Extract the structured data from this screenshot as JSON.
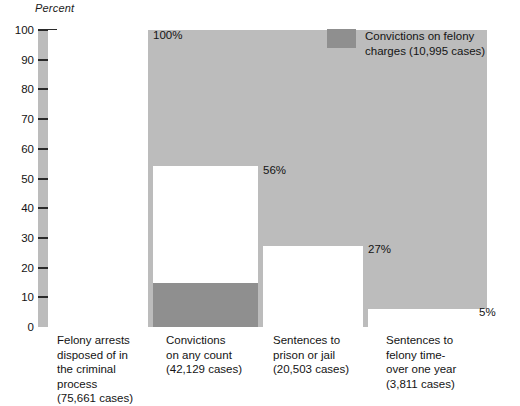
{
  "axis": {
    "title": "Percent",
    "ticks": [
      100,
      90,
      80,
      70,
      60,
      50,
      40,
      30,
      20,
      10,
      0
    ],
    "tick_labels": [
      "100",
      "90",
      "80",
      "70",
      "60",
      "50",
      "40",
      "30",
      "20",
      "10",
      "0"
    ],
    "min": 0,
    "max": 100
  },
  "legend": {
    "label": "Convictions on felony\ncharges (10,995 cases)",
    "swatch_color": "#8f8f8f",
    "swatch_name": "felony-convictions-swatch"
  },
  "colors": {
    "plot_background": "#bcbcbc",
    "bar_fill": "#ffffff",
    "highlight_fill": "#8f8f8f",
    "text": "#141414",
    "tick": "#2a2a2a"
  },
  "bars": [
    {
      "id": "felony-arrests",
      "value_label": "100%",
      "label": "Felony arrests\ndisposed of in\nthe criminal\nprocess\n(75,661 cases)",
      "cases_label": "(75,661 cases)",
      "category": "Felony arrests disposed of in the criminal process"
    },
    {
      "id": "convictions-any-count",
      "value_label": "56%",
      "label": "Convictions\non any count\n(42,129 cases)",
      "cases_label": "(42,129 cases)",
      "category": "Convictions on any count",
      "sub_value_label": "15%",
      "sub_category": "Convictions on felony charges"
    },
    {
      "id": "sentences-prison-jail",
      "value_label": "27%",
      "label": "Sentences to\nprison or jail\n(20,503 cases)",
      "cases_label": "(20,503 cases)",
      "category": "Sentences to prison or jail"
    },
    {
      "id": "sentences-felony-time",
      "value_label": "5%",
      "label": "Sentences to\nfelony time-\nover one year\n(3,811 cases)",
      "cases_label": "(3,811 cases)",
      "category": "Sentences to felony time-over one year"
    }
  ],
  "chart_data": {
    "type": "bar",
    "title": "",
    "subtitle": "",
    "xlabel": "",
    "ylabel": "Percent",
    "ylim": [
      0,
      100
    ],
    "grid": false,
    "legend_position": "top-right",
    "y_ticks": [
      0,
      10,
      20,
      30,
      40,
      50,
      60,
      70,
      80,
      90,
      100
    ],
    "categories": [
      "Felony arrests disposed of in the criminal process (75,661 cases)",
      "Convictions on any count (42,129 cases)",
      "Sentences to prison or jail (20,503 cases)",
      "Sentences to felony time-over one year (3,811 cases)"
    ],
    "category_case_counts": [
      75661,
      42129,
      20503,
      3811
    ],
    "series": [
      {
        "name": "All cases (percent of felony arrests)",
        "values": [
          100,
          56,
          27,
          5
        ],
        "value_labels": [
          "100%",
          "56%",
          "27%",
          "5%"
        ],
        "color": "#ffffff"
      },
      {
        "name": "Convictions on felony charges (10,995 cases)",
        "values": [
          null,
          15,
          null,
          null
        ],
        "value_labels": [
          null,
          "15%",
          null,
          null
        ],
        "color": "#8f8f8f"
      }
    ],
    "annotations": [
      "100% = 75,661 cases",
      "56% = 42,129 cases",
      "15% = 10,995 cases (convictions on felony charges)",
      "27% = 20,503 cases",
      "5% = 3,811 cases"
    ]
  }
}
